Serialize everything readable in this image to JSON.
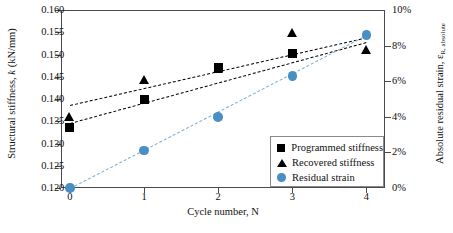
{
  "chart_data": {
    "type": "scatter",
    "title": "",
    "xlabel": "Cycle number, N",
    "ylabel": "Structural stiffness, k (kN/mm)",
    "y2label": "Absolute residual strain, εR, absolute",
    "x": [
      0,
      1,
      2,
      3,
      4
    ],
    "xtick_labels": [
      "0",
      "1",
      "2",
      "3",
      "4"
    ],
    "xlim": [
      -0.12,
      4.25
    ],
    "ylim": [
      0.12,
      0.16
    ],
    "ytick_labels": [
      "0.120",
      "0.125",
      "0.130",
      "0.135",
      "0.140",
      "0.145",
      "0.150",
      "0.155",
      "0.160"
    ],
    "ytick_values": [
      0.12,
      0.125,
      0.13,
      0.135,
      0.14,
      0.145,
      0.15,
      0.155,
      0.16
    ],
    "y2lim": [
      0,
      10
    ],
    "y2tick_labels": [
      "0%",
      "2%",
      "4%",
      "6%",
      "8%",
      "10%"
    ],
    "y2tick_values": [
      0,
      2,
      4,
      6,
      8,
      10
    ],
    "grid": false,
    "legend_position": "bottom-right",
    "series": [
      {
        "name": "Programmed stiffness",
        "marker": "square",
        "color": "#000000",
        "axis": "left",
        "x": [
          0,
          1,
          2,
          3
        ],
        "values": [
          0.1335,
          0.14,
          0.147,
          0.1502
        ],
        "trendline": {
          "x0": 0,
          "y0": 0.1345,
          "x1": 4,
          "y1": 0.1527
        }
      },
      {
        "name": "Recovered stiffness",
        "marker": "triangle",
        "color": "#000000",
        "axis": "left",
        "x": [
          0,
          1,
          2,
          3,
          4
        ],
        "values": [
          0.136,
          0.1443,
          0.1468,
          0.1547,
          0.151
        ],
        "trendline": {
          "x0": 0,
          "y0": 0.1386,
          "x1": 4,
          "y1": 0.1538
        }
      },
      {
        "name": "Residual strain",
        "marker": "circle",
        "color": "#4a8fc4",
        "axis": "right",
        "x": [
          0,
          1,
          2,
          3,
          4
        ],
        "values": [
          0.0,
          2.1,
          4.0,
          6.3,
          8.6
        ],
        "trendline": {
          "x0": 0,
          "y0": 0.0,
          "x1": 4,
          "y1": 8.6
        }
      }
    ]
  },
  "legend": {
    "items": [
      {
        "label": "Programmed stiffness",
        "marker": "square"
      },
      {
        "label": "Recovered stiffness",
        "marker": "triangle"
      },
      {
        "label": "Residual strain",
        "marker": "circle"
      }
    ]
  },
  "colors": {
    "residual_strain": "#4a8fc4",
    "residual_strain_trend": "#7badd4",
    "stiffness": "#000000",
    "axis": "#4a4a4a"
  }
}
